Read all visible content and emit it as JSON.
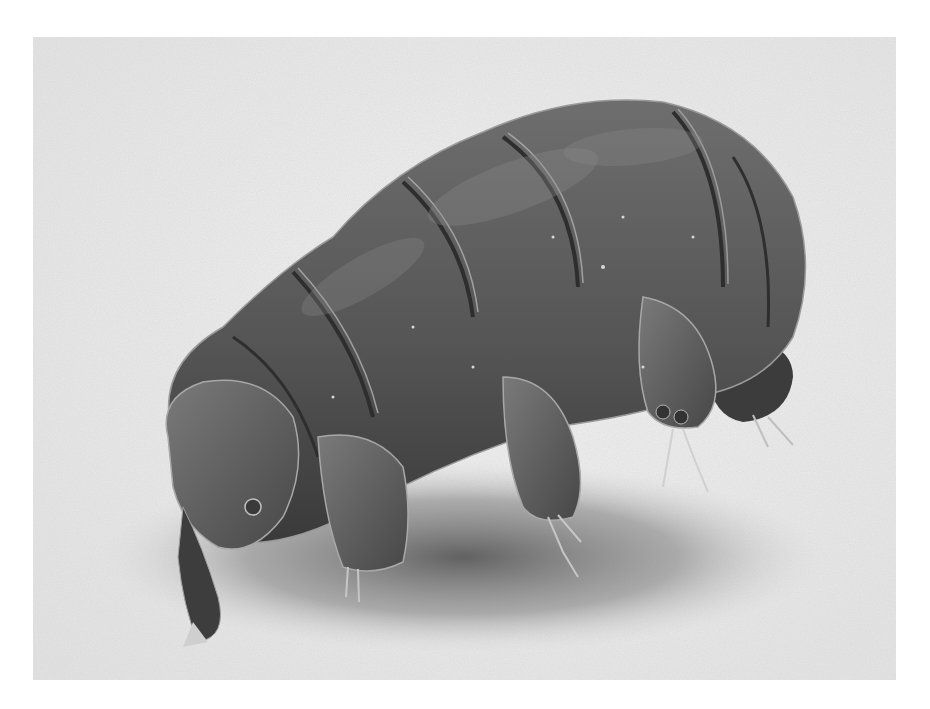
{
  "image": {
    "subject": "tardigrade",
    "description": "Scanning electron micrograph of a tardigrade (water bear) on a flat surface",
    "style": "grayscale SEM",
    "frame": {
      "x": 33,
      "y": 37,
      "width": 863,
      "height": 643
    },
    "colors": {
      "page_background": "#ffffff",
      "substrate_light": "#ededed",
      "substrate_mid": "#d6d6d6",
      "shadow": "#5e5e5e",
      "body_dark": "#3f3f3f",
      "body_mid": "#5a5a5a",
      "body_highlight": "#8c8c8c",
      "edge_highlight": "#c8c8c8"
    }
  }
}
